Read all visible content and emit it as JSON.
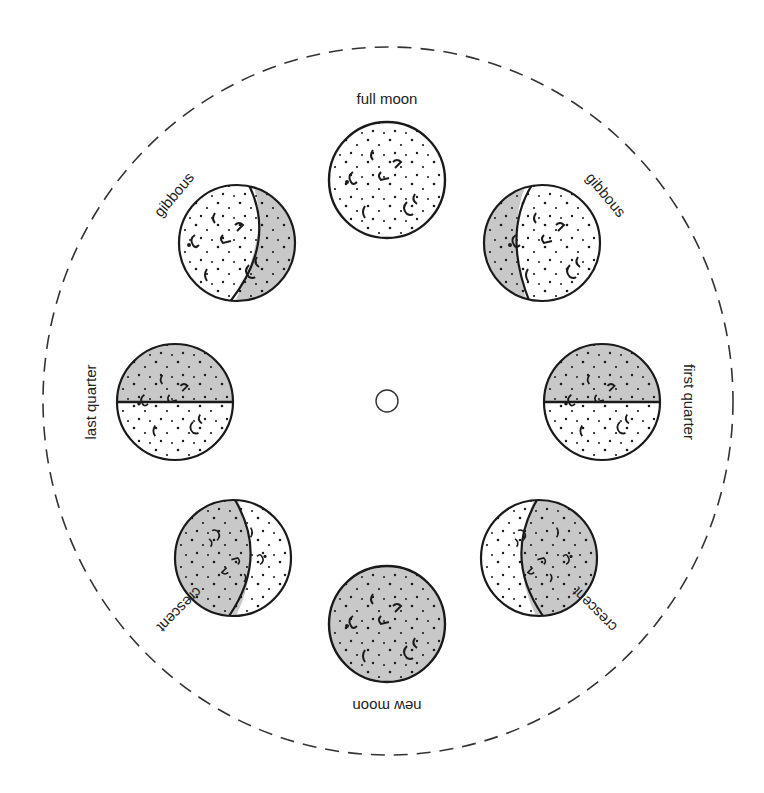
{
  "diagram": {
    "colors": {
      "lit": "#ffffff",
      "shadow": "#c8c8c8",
      "ink": "#1a1a1a",
      "dashed": "#333333"
    },
    "outer_circle": {
      "style": "dashed"
    },
    "center_hole": {
      "shape": "circle"
    },
    "phases": [
      {
        "id": "full",
        "label": "full moon"
      },
      {
        "id": "gibbous-right",
        "label": "gibbous"
      },
      {
        "id": "first-quarter",
        "label": "first quarter"
      },
      {
        "id": "crescent-right",
        "label": "crescent"
      },
      {
        "id": "new",
        "label": "new moon"
      },
      {
        "id": "crescent-left",
        "label": "crescent"
      },
      {
        "id": "last-quarter",
        "label": "last quarter"
      },
      {
        "id": "gibbous-left",
        "label": "gibbous"
      }
    ]
  }
}
